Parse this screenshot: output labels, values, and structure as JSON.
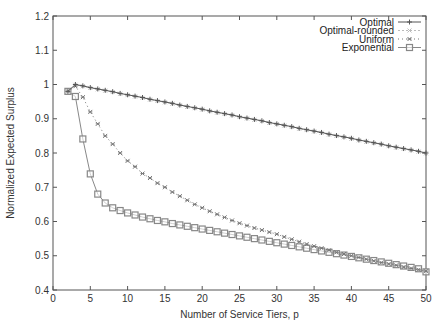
{
  "chart_data": {
    "type": "line",
    "title": "",
    "xlabel": "Number of Service Tiers, p",
    "ylabel": "Normalized Expected Surplus",
    "xlim": [
      0,
      50
    ],
    "ylim": [
      0.4,
      1.2
    ],
    "xticks": [
      0,
      5,
      10,
      15,
      20,
      25,
      30,
      35,
      40,
      45,
      50
    ],
    "yticks": [
      0.4,
      0.5,
      0.6,
      0.7,
      0.8,
      0.9,
      1,
      1.1,
      1.2
    ],
    "ytick_labels": [
      "0.4",
      "0.5",
      "0.6",
      "0.7",
      "0.8",
      "0.9",
      "1",
      "1.1",
      "1.2"
    ],
    "grid": false,
    "legend_position": "top-right",
    "x": [
      2,
      3,
      4,
      5,
      6,
      7,
      8,
      9,
      10,
      11,
      12,
      13,
      14,
      15,
      16,
      17,
      18,
      19,
      20,
      21,
      22,
      23,
      24,
      25,
      26,
      27,
      28,
      29,
      30,
      31,
      32,
      33,
      34,
      35,
      36,
      37,
      38,
      39,
      40,
      41,
      42,
      43,
      44,
      45,
      46,
      47,
      48,
      49,
      50
    ],
    "series": [
      {
        "name": "Optimal",
        "marker": "plus",
        "color": "#555555",
        "dash": "",
        "values": [
          0.98,
          1.0,
          0.996,
          0.991,
          0.987,
          0.983,
          0.979,
          0.974,
          0.97,
          0.966,
          0.962,
          0.957,
          0.953,
          0.949,
          0.945,
          0.94,
          0.936,
          0.932,
          0.928,
          0.923,
          0.919,
          0.915,
          0.911,
          0.906,
          0.902,
          0.898,
          0.894,
          0.889,
          0.885,
          0.881,
          0.877,
          0.872,
          0.868,
          0.864,
          0.86,
          0.855,
          0.851,
          0.847,
          0.843,
          0.838,
          0.834,
          0.83,
          0.826,
          0.821,
          0.817,
          0.813,
          0.809,
          0.805,
          0.8
        ]
      },
      {
        "name": "Optimal-rounded",
        "marker": "x",
        "color": "#bbbbbb",
        "dash": "2,2",
        "values": [
          0.98,
          0.999,
          0.995,
          0.99,
          0.986,
          0.982,
          0.978,
          0.973,
          0.969,
          0.965,
          0.961,
          0.956,
          0.952,
          0.948,
          0.944,
          0.939,
          0.935,
          0.931,
          0.927,
          0.922,
          0.918,
          0.914,
          0.91,
          0.905,
          0.901,
          0.897,
          0.893,
          0.888,
          0.884,
          0.88,
          0.876,
          0.871,
          0.867,
          0.863,
          0.859,
          0.854,
          0.85,
          0.846,
          0.842,
          0.837,
          0.833,
          0.829,
          0.825,
          0.82,
          0.816,
          0.812,
          0.808,
          0.804,
          0.799
        ]
      },
      {
        "name": "Uniform",
        "marker": "star",
        "color": "#777777",
        "dash": "1,3",
        "values": [
          0.98,
          0.995,
          0.963,
          0.92,
          0.885,
          0.85,
          0.826,
          0.8,
          0.777,
          0.76,
          0.74,
          0.727,
          0.712,
          0.7,
          0.686,
          0.674,
          0.662,
          0.65,
          0.64,
          0.63,
          0.621,
          0.612,
          0.603,
          0.595,
          0.588,
          0.581,
          0.575,
          0.569,
          0.563,
          0.555,
          0.548,
          0.541,
          0.534,
          0.528,
          0.522,
          0.516,
          0.51,
          0.505,
          0.5,
          0.495,
          0.49,
          0.485,
          0.48,
          0.476,
          0.472,
          0.467,
          0.463,
          0.459,
          0.455
        ]
      },
      {
        "name": "Exponential",
        "marker": "square",
        "color": "#888888",
        "dash": "",
        "values": [
          0.98,
          0.965,
          0.841,
          0.739,
          0.68,
          0.654,
          0.64,
          0.632,
          0.625,
          0.619,
          0.613,
          0.608,
          0.603,
          0.599,
          0.594,
          0.59,
          0.586,
          0.582,
          0.578,
          0.574,
          0.57,
          0.566,
          0.562,
          0.558,
          0.554,
          0.55,
          0.546,
          0.542,
          0.538,
          0.534,
          0.53,
          0.526,
          0.522,
          0.518,
          0.514,
          0.51,
          0.506,
          0.502,
          0.498,
          0.494,
          0.49,
          0.486,
          0.482,
          0.478,
          0.474,
          0.47,
          0.466,
          0.462,
          0.453
        ]
      }
    ]
  },
  "axes": {
    "xlabel": "Number of Service Tiers, p",
    "ylabel": "Normalized Expected Surplus"
  },
  "legend": {
    "items": [
      {
        "label": "Optimal"
      },
      {
        "label": "Optimal-rounded"
      },
      {
        "label": "Uniform"
      },
      {
        "label": "Exponential"
      }
    ]
  },
  "colors": {
    "axis": "#555555",
    "text": "#333333"
  }
}
